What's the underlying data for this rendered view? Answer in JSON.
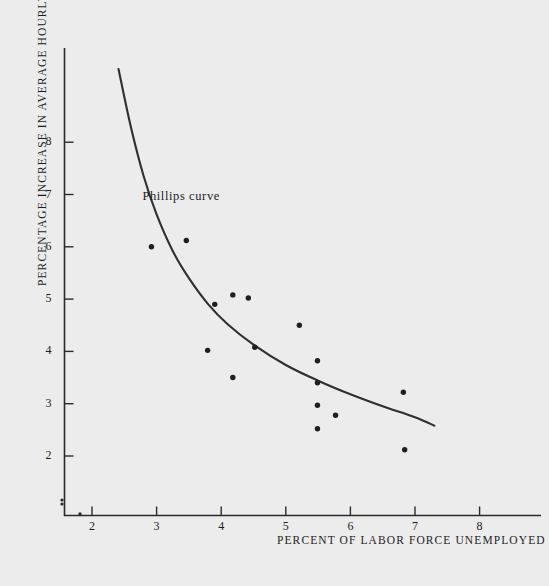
{
  "figure": {
    "background_color": "#ececec",
    "ink_color": "#2a2a2a"
  },
  "chart_data": {
    "type": "scatter",
    "title": "",
    "subtitle": "",
    "xlabel": "PERCENT OF LABOR FORCE UNEMPLOYED",
    "ylabel": "PERCENTAGE INCREASE IN AVERAGE HOURLY EARNINGS",
    "xlim": [
      1.5,
      8.5
    ],
    "ylim": [
      1.6,
      9.4
    ],
    "xticks": [
      2,
      3,
      4,
      5,
      6,
      7,
      8
    ],
    "yticks": [
      2,
      3,
      4,
      5,
      6,
      7,
      8
    ],
    "xtick_labels": [
      "2",
      "3",
      "4",
      "5",
      "6",
      "7",
      "8"
    ],
    "ytick_labels": [
      "2",
      "3",
      "4",
      "5",
      "6",
      "7",
      "8"
    ],
    "grid": false,
    "legend": "none",
    "origin_marker": "0",
    "series": [
      {
        "name": "observations",
        "type": "scatter",
        "marker": "filled-circle",
        "points": [
          {
            "x": 2.92,
            "y": 6.0
          },
          {
            "x": 3.46,
            "y": 6.12
          },
          {
            "x": 3.79,
            "y": 4.02
          },
          {
            "x": 3.9,
            "y": 4.9
          },
          {
            "x": 4.18,
            "y": 5.08
          },
          {
            "x": 4.18,
            "y": 3.5
          },
          {
            "x": 4.42,
            "y": 5.02
          },
          {
            "x": 4.52,
            "y": 4.08
          },
          {
            "x": 5.21,
            "y": 4.5
          },
          {
            "x": 5.49,
            "y": 3.82
          },
          {
            "x": 5.49,
            "y": 3.4
          },
          {
            "x": 5.49,
            "y": 2.97
          },
          {
            "x": 5.49,
            "y": 2.52
          },
          {
            "x": 5.77,
            "y": 2.78
          },
          {
            "x": 6.82,
            "y": 3.22
          },
          {
            "x": 6.84,
            "y": 2.12
          }
        ]
      },
      {
        "name": "Phillips curve",
        "type": "line",
        "annotation": "Phillips curve",
        "points": [
          {
            "x": 2.41,
            "y": 9.4
          },
          {
            "x": 2.6,
            "y": 8.3
          },
          {
            "x": 2.8,
            "y": 7.35
          },
          {
            "x": 3.0,
            "y": 6.62
          },
          {
            "x": 3.25,
            "y": 5.92
          },
          {
            "x": 3.5,
            "y": 5.4
          },
          {
            "x": 3.8,
            "y": 4.9
          },
          {
            "x": 4.1,
            "y": 4.52
          },
          {
            "x": 4.5,
            "y": 4.13
          },
          {
            "x": 5.0,
            "y": 3.74
          },
          {
            "x": 5.5,
            "y": 3.44
          },
          {
            "x": 6.0,
            "y": 3.18
          },
          {
            "x": 6.5,
            "y": 2.95
          },
          {
            "x": 7.0,
            "y": 2.74
          },
          {
            "x": 7.3,
            "y": 2.58
          }
        ]
      }
    ]
  },
  "annotations": {
    "curve_label": "Phillips curve"
  },
  "axes": {
    "x_title": "PERCENT OF LABOR FORCE UNEMPLOYED",
    "y_title": "PERCENTAGE INCREASE IN AVERAGE HOURLY EARNINGS",
    "x_tick_labels": [
      "2",
      "3",
      "4",
      "5",
      "6",
      "7",
      "8"
    ],
    "y_tick_labels": [
      "2",
      "3",
      "4",
      "5",
      "6",
      "7",
      "8"
    ],
    "origin_label": "0"
  }
}
